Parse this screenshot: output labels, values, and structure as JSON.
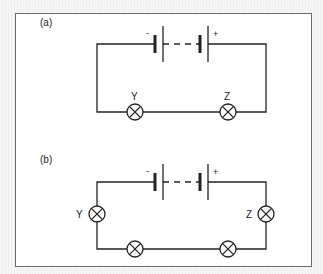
{
  "figure": {
    "panels": [
      {
        "label": "(a)",
        "battery": {
          "negative": "-",
          "positive": "+"
        },
        "lamps": [
          {
            "name": "Y",
            "position": "bottom-left"
          },
          {
            "name": "Z",
            "position": "bottom-right"
          }
        ]
      },
      {
        "label": "(b)",
        "battery": {
          "negative": "-",
          "positive": "+"
        },
        "lamps": [
          {
            "name": "Y",
            "position": "left-side"
          },
          {
            "name": "Z",
            "position": "right-side"
          },
          {
            "name": "",
            "position": "bottom-left"
          },
          {
            "name": "",
            "position": "bottom-right"
          }
        ]
      }
    ],
    "colors": {
      "line": "#222222",
      "frame": "#6a6a6a",
      "background": "#ffffff"
    }
  }
}
